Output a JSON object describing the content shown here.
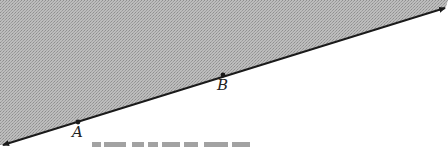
{
  "diagram": {
    "type": "half-plane",
    "shading": {
      "region": "above line",
      "pattern": "stippled gray",
      "color": "#b4b4b4",
      "dot_color": "#8c8c8c"
    },
    "line": {
      "start": [
        2,
        145
      ],
      "end": [
        446,
        7
      ],
      "arrows": "both",
      "color": "#1a1a1a"
    },
    "points": [
      {
        "label": "A",
        "x": 78,
        "y": 122
      },
      {
        "label": "B",
        "x": 223,
        "y": 75
      }
    ],
    "caption": {
      "visible": "truncated (only glyph tops visible at bottom edge)"
    }
  }
}
